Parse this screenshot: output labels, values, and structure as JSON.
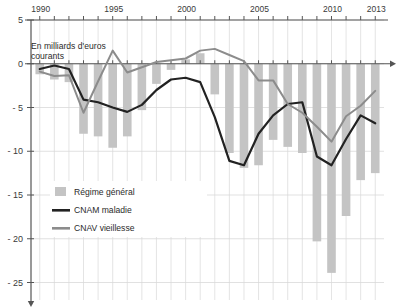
{
  "chart_data": {
    "type": "bar",
    "title": "",
    "subtitle": "",
    "unit_note": "En milliards d'euros courants",
    "xlabel": "",
    "ylabel": "",
    "ylim": [
      -27,
      5
    ],
    "xlim": [
      1989.4,
      2013.6
    ],
    "grid": true,
    "legend_position": "bottom-left",
    "y_ticks": [
      5,
      0,
      -5,
      -10,
      -15,
      -20,
      -25
    ],
    "y_tick_labels": [
      "5",
      "0",
      "- 5",
      "- 10",
      "- 15",
      "- 20",
      "- 25"
    ],
    "x_ticks": [
      1990,
      1991,
      1992,
      1993,
      1994,
      1995,
      1996,
      1997,
      1998,
      1999,
      2000,
      2001,
      2002,
      2003,
      2004,
      2005,
      2006,
      2007,
      2008,
      2009,
      2010,
      2011,
      2012,
      2013
    ],
    "x_tick_labels_shown": [
      "1990",
      "1995",
      "2000",
      "2005",
      "2010",
      "2013"
    ],
    "categories": [
      1990,
      1991,
      1992,
      1993,
      1994,
      1995,
      1996,
      1997,
      1998,
      1999,
      2000,
      2001,
      2002,
      2003,
      2004,
      2005,
      2006,
      2007,
      2008,
      2009,
      2010,
      2011,
      2012,
      2013
    ],
    "series": [
      {
        "name": "Régime général",
        "kind": "bar",
        "color": "#c4c4c4",
        "values": [
          -1.2,
          -1.8,
          -2.1,
          -8.0,
          -8.3,
          -9.6,
          -8.3,
          -5.3,
          -2.3,
          -0.7,
          0.5,
          1.2,
          -3.5,
          -10.2,
          -11.9,
          -11.6,
          -8.7,
          -9.5,
          -10.2,
          -20.3,
          -23.9,
          -17.4,
          -13.3,
          -12.5
        ]
      },
      {
        "name": "CNAM maladie",
        "kind": "line",
        "color": "#222222",
        "values": [
          -0.6,
          -0.2,
          -0.6,
          -4.1,
          -4.4,
          -5.0,
          -5.5,
          -4.7,
          -3.0,
          -1.8,
          -1.6,
          -2.1,
          -6.1,
          -11.1,
          -11.6,
          -8.0,
          -5.9,
          -4.6,
          -4.4,
          -10.6,
          -11.6,
          -8.6,
          -5.9,
          -6.8
        ]
      },
      {
        "name": "CNAV vieillesse",
        "kind": "line",
        "color": "#8c8c8c",
        "values": [
          -0.9,
          -1.4,
          -1.3,
          -5.6,
          -2.0,
          1.5,
          -1.0,
          -0.4,
          0.2,
          0.4,
          0.6,
          1.5,
          1.7,
          1.0,
          0.3,
          -1.9,
          -1.9,
          -4.6,
          -5.6,
          -7.2,
          -8.9,
          -6.0,
          -4.8,
          -3.1
        ]
      }
    ]
  },
  "axis": {
    "y_label_5": "5",
    "y_label_0": "0",
    "y_label_m5": "- 5",
    "y_label_m10": "- 10",
    "y_label_m15": "- 15",
    "y_label_m20": "- 20",
    "y_label_m25": "- 25",
    "x_label_1990": "1990",
    "x_label_1995": "1995",
    "x_label_2000": "2000",
    "x_label_2005": "2005",
    "x_label_2010": "2010",
    "x_label_2013": "2013"
  },
  "annotations": {
    "unit_line1": "En milliards d'euros",
    "unit_line2": "courants"
  },
  "legend": {
    "items": [
      {
        "label": "Régime général",
        "color": "#c4c4c4",
        "marker": "swatch"
      },
      {
        "label": "CNAM maladie",
        "color": "#222222",
        "marker": "line-thick"
      },
      {
        "label": "CNAV vieillesse",
        "color": "#8c8c8c",
        "marker": "line-thick"
      }
    ]
  },
  "colors": {
    "bar": "#c4c4c4",
    "cnam": "#222222",
    "cnav": "#8c8c8c",
    "grid": "#d9d9d9",
    "axis": "#555555",
    "text": "#333333",
    "background": "#ffffff"
  }
}
